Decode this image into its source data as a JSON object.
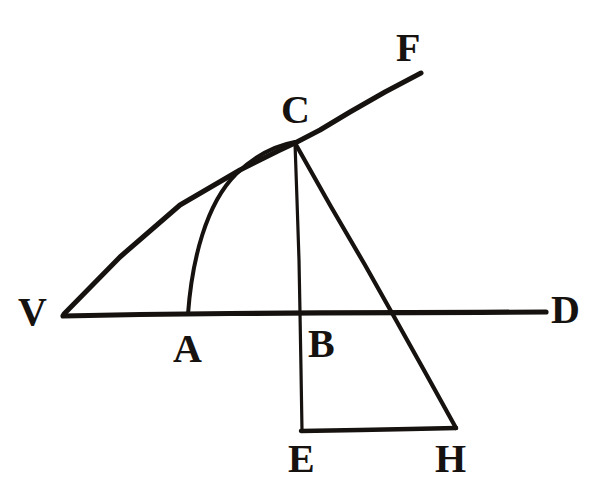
{
  "figure": {
    "kind": "geometric-diagram",
    "background_color": "#ffffff",
    "ink_color": "#16120f",
    "labels": [
      {
        "id": "V",
        "text": "V",
        "x": 18,
        "y": 292,
        "font_size": 40
      },
      {
        "id": "C",
        "text": "C",
        "x": 281,
        "y": 90,
        "font_size": 40
      },
      {
        "id": "F",
        "text": "F",
        "x": 396,
        "y": 28,
        "font_size": 40
      },
      {
        "id": "D",
        "text": "D",
        "x": 551,
        "y": 290,
        "font_size": 40
      },
      {
        "id": "A",
        "text": "A",
        "x": 173,
        "y": 329,
        "font_size": 40
      },
      {
        "id": "B",
        "text": "B",
        "x": 308,
        "y": 324,
        "font_size": 40
      },
      {
        "id": "E",
        "text": "E",
        "x": 288,
        "y": 439,
        "font_size": 40
      },
      {
        "id": "H",
        "text": "H",
        "x": 435,
        "y": 439,
        "font_size": 40
      }
    ],
    "points": {
      "V": {
        "x": 63,
        "y": 315
      },
      "A": {
        "x": 188,
        "y": 313
      },
      "B": {
        "x": 300,
        "y": 313
      },
      "C": {
        "x": 295,
        "y": 142
      },
      "D": {
        "x": 546,
        "y": 312
      },
      "E": {
        "x": 302,
        "y": 431
      },
      "F": {
        "x": 421,
        "y": 73
      },
      "H": {
        "x": 456,
        "y": 428
      },
      "X_CH_on_axis": {
        "x": 392,
        "y": 313
      }
    },
    "strokes": [
      {
        "name": "axis-vd",
        "type": "line",
        "from": "V",
        "to": "D",
        "width": 5
      },
      {
        "name": "line-vcf",
        "type": "line",
        "from": "V",
        "through": "C",
        "to": "F",
        "width": 5
      },
      {
        "name": "curve-acf",
        "type": "curve",
        "from": "A",
        "to": "C",
        "width": 4
      },
      {
        "name": "line-ce",
        "type": "line",
        "from": "C",
        "to": "E",
        "width": 3
      },
      {
        "name": "line-ch",
        "type": "line",
        "from": "C",
        "to": "H",
        "width": 4
      },
      {
        "name": "segment-eh",
        "type": "line",
        "from": "E",
        "to": "H",
        "width": 4
      }
    ]
  }
}
